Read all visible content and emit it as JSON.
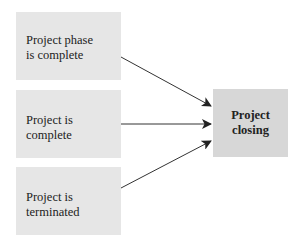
{
  "diagram": {
    "sources": [
      {
        "id": "phase-complete",
        "lines": [
          "Project phase",
          "is complete"
        ]
      },
      {
        "id": "project-complete",
        "lines": [
          "Project is",
          "complete"
        ]
      },
      {
        "id": "project-terminated",
        "lines": [
          "Project is",
          "terminated"
        ]
      }
    ],
    "target": {
      "id": "project-closing",
      "lines": [
        "Project",
        "closing"
      ]
    },
    "edges": [
      {
        "from": "phase-complete",
        "to": "project-closing"
      },
      {
        "from": "project-complete",
        "to": "project-closing"
      },
      {
        "from": "project-terminated",
        "to": "project-closing"
      }
    ],
    "colors": {
      "source_fill": "#e6e6e6",
      "target_fill": "#d7d7d7",
      "arrow": "#222222"
    }
  }
}
